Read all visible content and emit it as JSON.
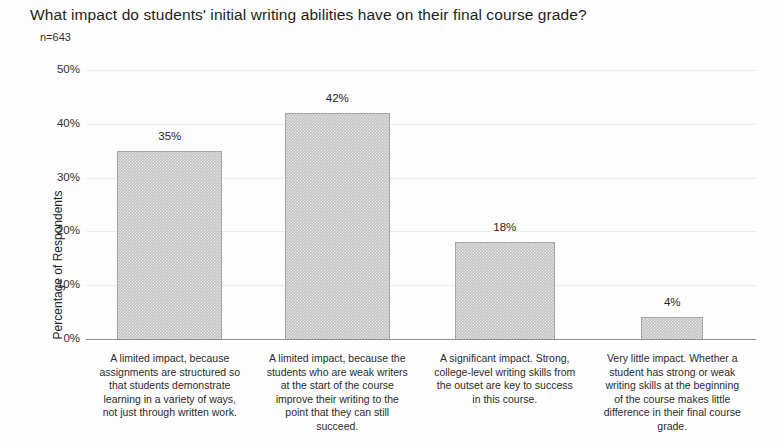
{
  "header": {
    "title": "What impact do students' initial writing abilities have on their final course grade?",
    "sample_size": "n=643"
  },
  "chart_data": {
    "type": "bar",
    "title": "What impact do students' initial writing abilities have on their final course grade?",
    "subtitle": "n=643",
    "xlabel": "",
    "ylabel": "Percentage of Respondents",
    "ylim": [
      0,
      50
    ],
    "grid": true,
    "legend": "none",
    "categories": [
      "A limited impact, because assignments are structured so that students demonstrate learning in a variety of ways, not just through written work.",
      "A limited impact, because the students who are weak writers at the start of the course improve their writing to the point that they can still succeed.",
      "A significant impact. Strong, college-level writing skills from the outset are key to success in this course.",
      "Very little impact. Whether a student has strong or weak writing skills at the beginning of the course makes little difference in their final course grade."
    ],
    "values": [
      35,
      42,
      18,
      4
    ],
    "data_labels": [
      "35%",
      "42%",
      "18%",
      "4%"
    ],
    "ytick_labels": [
      "0%",
      "10%",
      "20%",
      "30%",
      "40%",
      "50%"
    ],
    "ytick_values": [
      0,
      10,
      20,
      30,
      40,
      50
    ],
    "bar_color": "#c2c2c2",
    "bar_border_color": "#a5a5a5",
    "gridline_color": "#ededed",
    "axis_color": "#8d8d8d",
    "background_color": "#fdfdfd"
  },
  "category_label_lines": [
    [
      "A limited impact, because",
      "assignments are structured so",
      "that students demonstrate",
      "learning in a variety of ways,",
      "not just through written work."
    ],
    [
      "A limited impact, because the",
      "students who are weak writers",
      "at the start of the course",
      "improve their writing to the",
      "point that they can still",
      "succeed."
    ],
    [
      "A significant impact. Strong,",
      "college-level writing skills from",
      "the outset are key to success",
      "in this course."
    ],
    [
      "Very little impact. Whether a",
      "student has strong or weak",
      "writing skills at the beginning",
      "of the course makes little",
      "difference in their final course",
      "grade."
    ]
  ]
}
